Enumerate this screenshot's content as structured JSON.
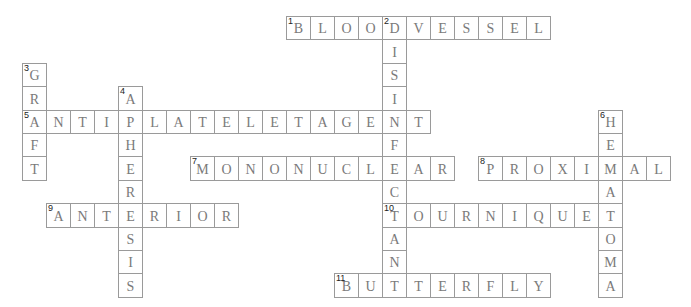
{
  "puzzle": {
    "grid": {
      "origin_x": 22,
      "origin_y": 16,
      "cell_w": 24,
      "cell_h": 23.4
    },
    "colors": {
      "border": "#9a9a9a",
      "letter": "#7a7a7a",
      "number": "#222222",
      "background": "#ffffff"
    },
    "entries": [
      {
        "number": "1",
        "answer": "BLOODVESSEL",
        "direction": "across",
        "col": 11,
        "row": 0
      },
      {
        "number": "2",
        "answer": "DISINFECTANT",
        "direction": "down",
        "col": 15,
        "row": 0
      },
      {
        "number": "3",
        "answer": "GRAFT",
        "direction": "down",
        "col": 0,
        "row": 2
      },
      {
        "number": "4",
        "answer": "APHERESIS",
        "direction": "down",
        "col": 4,
        "row": 3
      },
      {
        "number": "5",
        "answer": "ANTIPLATELETAGENT",
        "direction": "across",
        "col": 0,
        "row": 4
      },
      {
        "number": "6",
        "answer": "HEMATOMA",
        "direction": "down",
        "col": 24,
        "row": 4
      },
      {
        "number": "7",
        "answer": "MONONUCLEAR",
        "direction": "across",
        "col": 7,
        "row": 6
      },
      {
        "number": "8",
        "answer": "PROXIMAL",
        "direction": "across",
        "col": 19,
        "row": 6
      },
      {
        "number": "9",
        "answer": "ANTERIOR",
        "direction": "across",
        "col": 1,
        "row": 8
      },
      {
        "number": "10",
        "answer": "TOURNIQUET",
        "direction": "across",
        "col": 15,
        "row": 8
      },
      {
        "number": "11",
        "answer": "BUTTERFLY",
        "direction": "across",
        "col": 13,
        "row": 11
      }
    ]
  }
}
